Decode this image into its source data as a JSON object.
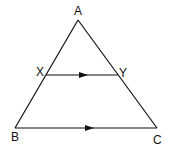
{
  "diagram": {
    "labels": {
      "A": "A",
      "B": "B",
      "C": "C",
      "X": "X",
      "Y": "Y"
    },
    "points": {
      "A": [
        78,
        20
      ],
      "B": [
        15,
        128
      ],
      "C": [
        157,
        128
      ],
      "X": [
        46,
        75
      ],
      "Y": [
        118,
        75
      ]
    },
    "segments": [
      "AB",
      "AC",
      "BC",
      "XY"
    ],
    "parallel": [
      "XY",
      "BC"
    ],
    "stroke_color": "#111111"
  }
}
